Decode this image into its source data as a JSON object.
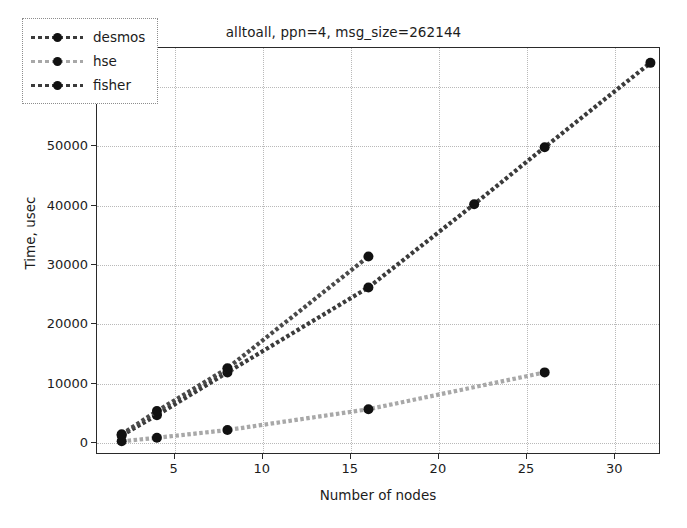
{
  "chart_data": {
    "type": "line",
    "title": "alltoall, ppn=4, msg_size=262144",
    "xlabel": "Number of nodes",
    "ylabel": "Time, usec",
    "xlim": [
      0.6,
      32.6
    ],
    "ylim": [
      -2000,
      66500
    ],
    "xticks": [
      5,
      10,
      15,
      20,
      25,
      30
    ],
    "yticks": [
      0,
      10000,
      20000,
      30000,
      40000,
      50000,
      60000
    ],
    "xtick_labels": [
      "5",
      "10",
      "15",
      "20",
      "25",
      "30"
    ],
    "ytick_labels": [
      "0",
      "10000",
      "20000",
      "30000",
      "40000",
      "50000",
      "60000"
    ],
    "grid": true,
    "grid_style": "dotted",
    "legend_position": "upper left",
    "marker": "circle",
    "linestyle": "dashed",
    "series": [
      {
        "name": "desmos",
        "color": "#3b3b3b",
        "x": [
          2,
          4,
          8,
          16,
          22,
          26,
          32
        ],
        "y": [
          1300,
          4700,
          11900,
          26200,
          40200,
          49800,
          64000
        ]
      },
      {
        "name": "hse",
        "color": "#a8a8a8",
        "x": [
          2,
          4,
          8,
          16,
          26
        ],
        "y": [
          300,
          900,
          2200,
          5700,
          11900
        ]
      },
      {
        "name": "fisher",
        "color": "#4a4a4a",
        "x": [
          2,
          4,
          8,
          16
        ],
        "y": [
          1500,
          5400,
          12600,
          31400
        ]
      }
    ]
  },
  "legend": {
    "items": [
      {
        "label": "desmos"
      },
      {
        "label": "hse"
      },
      {
        "label": "fisher"
      }
    ]
  }
}
